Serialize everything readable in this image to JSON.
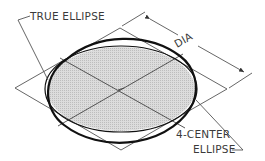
{
  "diagram": {
    "labels": {
      "true_ellipse": "TRUE ELLIPSE",
      "dia": "DIA",
      "four_center_line1": "4-CENTER",
      "four_center_line2": "ELLIPSE"
    },
    "geometry": {
      "center": [
        121,
        89
      ],
      "rhombus": {
        "left": [
          15,
          88
        ],
        "top": [
          120,
          28
        ],
        "right": [
          227,
          89
        ],
        "bottom": [
          121,
          150
        ]
      },
      "ellipse_semi_axes": [
        75,
        43
      ]
    },
    "colors": {
      "line": "#555555",
      "outline": "#111111",
      "fill": "#d8d8d8",
      "text": "#3a3a3a",
      "background": "#ffffff"
    }
  }
}
